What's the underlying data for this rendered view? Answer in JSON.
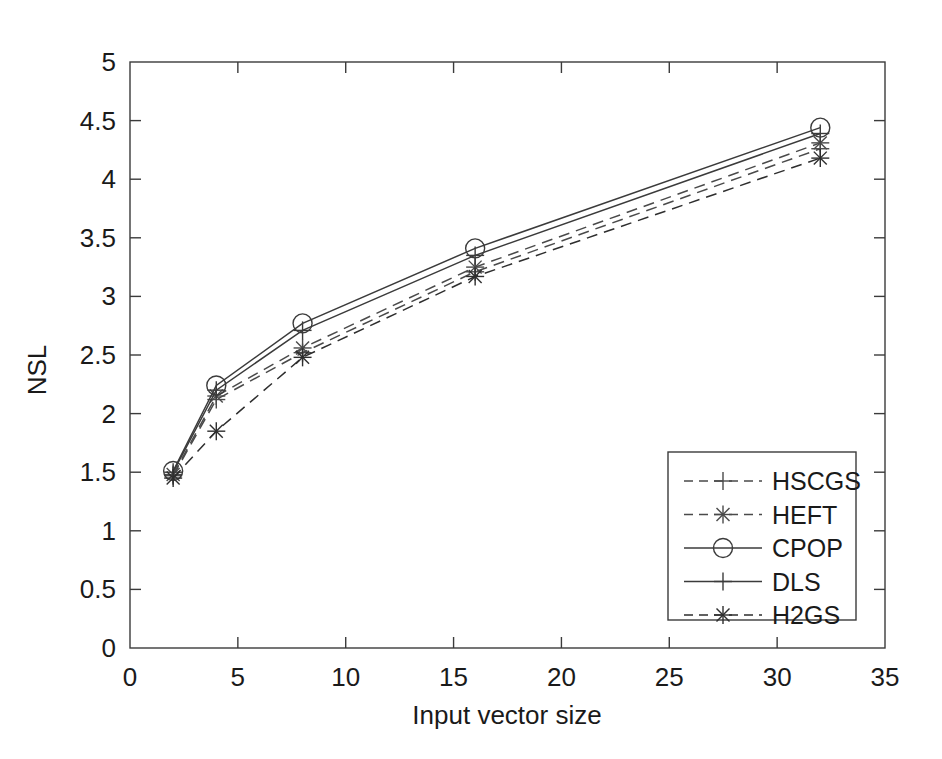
{
  "chart_data": {
    "type": "line",
    "title": "",
    "xlabel": "Input vector size",
    "ylabel": "NSL",
    "xlim": [
      0,
      35
    ],
    "ylim": [
      0,
      5
    ],
    "xticks": [
      0,
      5,
      10,
      15,
      20,
      25,
      30,
      35
    ],
    "yticks": [
      0,
      0.5,
      1,
      1.5,
      2,
      2.5,
      3,
      3.5,
      4,
      4.5,
      5
    ],
    "xtick_labels": [
      "0",
      "5",
      "10",
      "15",
      "20",
      "25",
      "30",
      "35"
    ],
    "ytick_labels": [
      "0",
      "0.5",
      "1",
      "1.5",
      "2",
      "2.5",
      "3",
      "3.5",
      "4",
      "4.5",
      "5"
    ],
    "grid": false,
    "legend_position": "lower right",
    "x": [
      2,
      4,
      8,
      16,
      32
    ],
    "series": [
      {
        "name": "HSCGS",
        "values": [
          1.47,
          2.12,
          2.52,
          3.21,
          4.26
        ],
        "style": "dashed",
        "marker": "plus",
        "color": "#4a4a4a"
      },
      {
        "name": "HEFT",
        "values": [
          1.48,
          2.15,
          2.56,
          3.25,
          4.31
        ],
        "style": "dashed",
        "marker": "asterisk",
        "color": "#4a4a4a"
      },
      {
        "name": "CPOP",
        "values": [
          1.51,
          2.24,
          2.77,
          3.41,
          4.44
        ],
        "style": "solid",
        "marker": "circle",
        "color": "#3b3b3b"
      },
      {
        "name": "DLS",
        "values": [
          1.5,
          2.2,
          2.71,
          3.35,
          4.39
        ],
        "style": "solid",
        "marker": "plus",
        "color": "#3b3b3b"
      },
      {
        "name": "H2GS",
        "values": [
          1.45,
          1.85,
          2.48,
          3.17,
          4.18
        ],
        "style": "dashed",
        "marker": "asterisk",
        "color": "#2e2e2e"
      }
    ]
  },
  "figure": {
    "background": "#ffffff",
    "axis_color": "#3b3b3b"
  }
}
